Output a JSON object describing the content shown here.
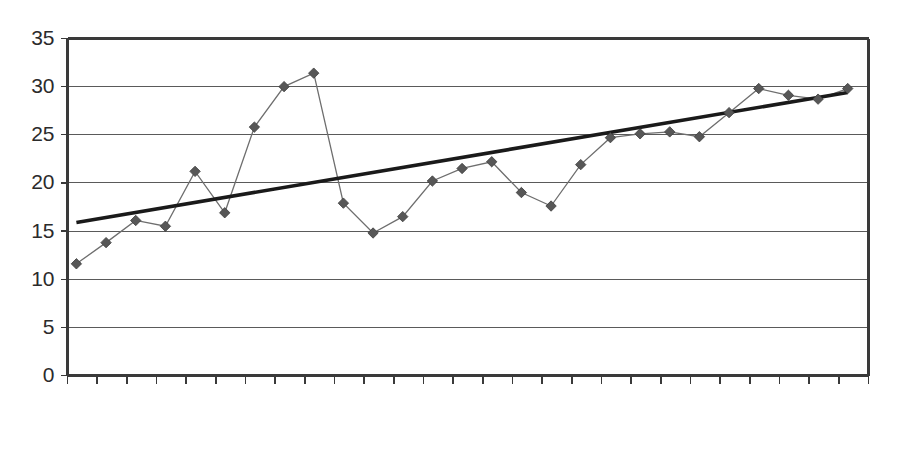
{
  "chart_data": {
    "type": "line",
    "title": "",
    "subtitle": "",
    "xlabel": "",
    "ylabel": "",
    "grid": true,
    "legend": false,
    "legend_position": "none",
    "xlim": [
      1952,
      1978
    ],
    "ylim": [
      0,
      35
    ],
    "y_ticks": [
      0,
      5,
      10,
      15,
      20,
      25,
      30,
      35
    ],
    "y_tick_labels": [
      "0",
      "5",
      "10",
      "15",
      "20",
      "25",
      "30",
      "35"
    ],
    "x_tick_labels": [
      "1952",
      "1954",
      "1956",
      "1958",
      "1960",
      "1962",
      "1964",
      "1966",
      "1968",
      "1970",
      "1972",
      "1974",
      "1976",
      "1978"
    ],
    "x_tick_every": 2,
    "x": [
      1952,
      1953,
      1954,
      1955,
      1956,
      1957,
      1958,
      1959,
      1960,
      1961,
      1962,
      1963,
      1964,
      1965,
      1966,
      1967,
      1968,
      1969,
      1970,
      1971,
      1972,
      1973,
      1974,
      1975,
      1976,
      1977,
      1978
    ],
    "series": [
      {
        "name": "data",
        "marker": "diamond",
        "color": "#575757",
        "values": [
          11.6,
          13.8,
          16.1,
          15.5,
          21.2,
          16.9,
          25.8,
          30.0,
          31.4,
          17.9,
          14.8,
          16.5,
          20.2,
          21.5,
          22.2,
          19.0,
          17.6,
          21.9,
          24.7,
          25.1,
          25.3,
          24.8,
          27.3,
          29.8,
          29.1,
          28.7,
          29.8
        ]
      },
      {
        "name": "trend",
        "type": "trendline",
        "color": "#1a1a1a",
        "start": [
          1952,
          15.9
        ],
        "end": [
          1978,
          29.4
        ]
      }
    ]
  },
  "axes": {
    "y_axis_name": "value-axis",
    "x_axis_name": "year-axis"
  }
}
